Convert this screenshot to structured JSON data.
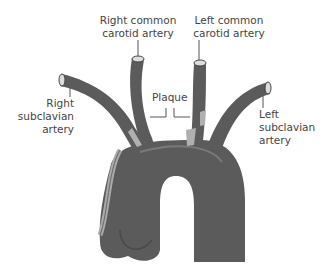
{
  "diagram": {
    "labels": {
      "right_common_carotid": [
        "Right common",
        "carotid artery"
      ],
      "left_common_carotid": [
        "Left common",
        "carotid artery"
      ],
      "right_subclavian": [
        "Right",
        "subclavian",
        "artery"
      ],
      "left_subclavian": [
        "Left",
        "subclavian",
        "artery"
      ],
      "plaque": "Plaque"
    },
    "colors": {
      "vessel": "#5b5b5b",
      "vessel_dark": "#4a4a4a",
      "highlight": "#7a7a7a",
      "plaque": "#b0b0b0",
      "text": "#444444",
      "leader": "#555555"
    }
  }
}
